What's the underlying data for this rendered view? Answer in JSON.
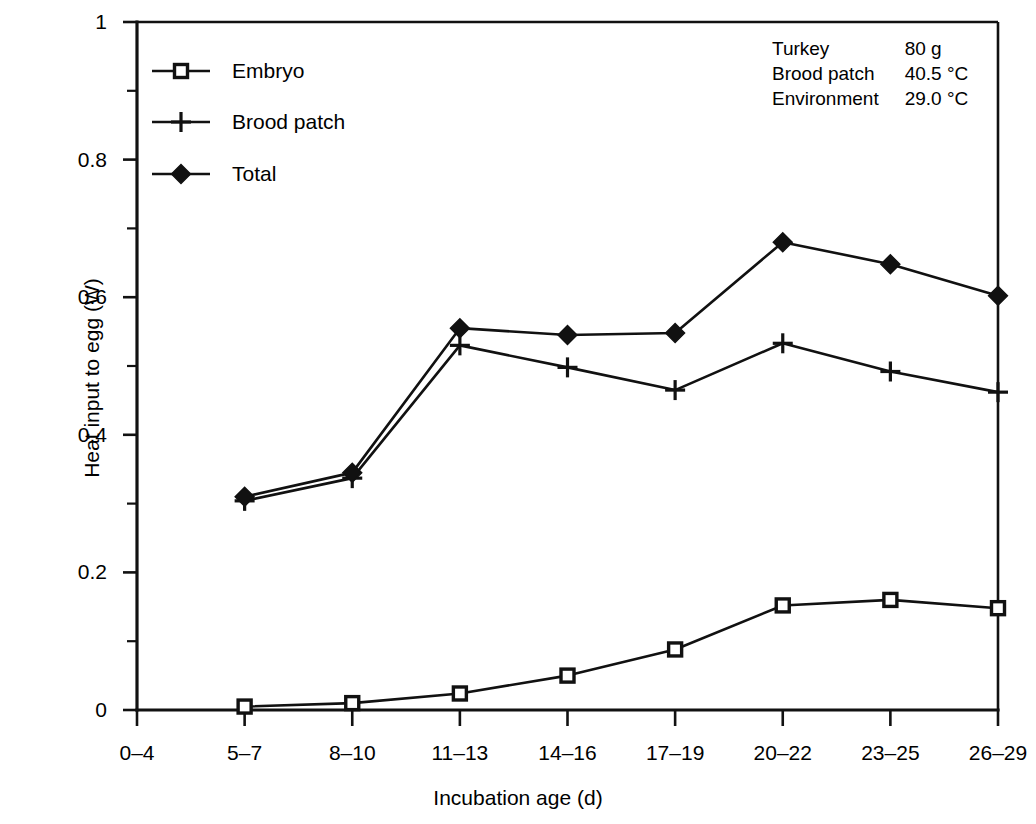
{
  "chart_data": {
    "type": "line",
    "title": "",
    "xlabel": "Incubation age (d)",
    "ylabel": "Heat input to egg (W)",
    "categories": [
      "0–4",
      "5–7",
      "8–10",
      "11–13",
      "14–16",
      "17–19",
      "20–22",
      "23–25",
      "26–29"
    ],
    "ylim": [
      0,
      1
    ],
    "yticks": [
      0,
      0.2,
      0.4,
      0.6,
      0.8,
      1
    ],
    "ytick_labels": [
      "0",
      "0.2",
      "0.4",
      "0.6",
      "0.8",
      "1"
    ],
    "yminor_step": 0.1,
    "grid": false,
    "legend_position": "upper-left inside axes",
    "series": [
      {
        "name": "Embryo",
        "marker": "open-square",
        "values": [
          null,
          0.005,
          0.01,
          0.024,
          0.05,
          0.088,
          0.152,
          0.16,
          0.148
        ]
      },
      {
        "name": "Brood patch",
        "marker": "plus",
        "values": [
          null,
          0.304,
          0.337,
          0.53,
          0.498,
          0.465,
          0.533,
          0.492,
          0.462
        ]
      },
      {
        "name": "Total",
        "marker": "filled-diamond",
        "values": [
          null,
          0.31,
          0.345,
          0.555,
          0.545,
          0.548,
          0.68,
          0.648,
          0.602
        ]
      }
    ],
    "annotations": [
      {
        "label": "Turkey",
        "value": "80 g"
      },
      {
        "label": "Brood patch",
        "value": "40.5 °C"
      },
      {
        "label": "Environment",
        "value": "29.0 °C"
      }
    ],
    "colors": {
      "line": "#111111",
      "marker_fill": "#111111",
      "open_marker_fill": "#ffffff",
      "background": "#ffffff"
    }
  }
}
